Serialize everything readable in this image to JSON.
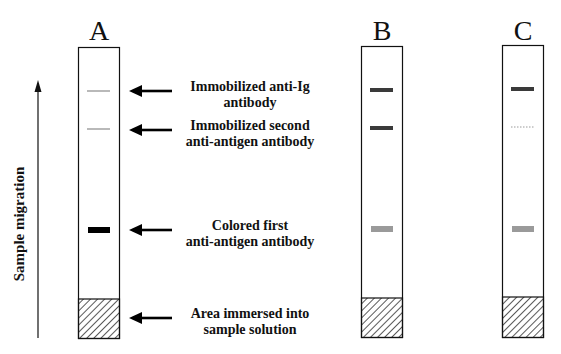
{
  "migration_label": "Sample migration",
  "strips": [
    {
      "id": "A",
      "label": "A",
      "bands": [
        {
          "role": "anti-ig",
          "style": "thin-line",
          "color": "#8a8a8a"
        },
        {
          "role": "second-antibody",
          "style": "thin-line",
          "color": "#8a8a8a"
        },
        {
          "role": "colored-first-antibody",
          "style": "thick-bar",
          "color": "#000000"
        }
      ]
    },
    {
      "id": "B",
      "label": "B",
      "bands": [
        {
          "role": "anti-ig",
          "style": "medium-bar",
          "color": "#3a3a3a"
        },
        {
          "role": "second-antibody",
          "style": "medium-bar",
          "color": "#3a3a3a"
        },
        {
          "role": "colored-first-antibody",
          "style": "medium-bar",
          "color": "#9a9a9a"
        }
      ]
    },
    {
      "id": "C",
      "label": "C",
      "bands": [
        {
          "role": "anti-ig",
          "style": "medium-bar",
          "color": "#3a3a3a"
        },
        {
          "role": "second-antibody",
          "style": "dotted",
          "color": "#9a9a9a"
        },
        {
          "role": "colored-first-antibody",
          "style": "medium-bar",
          "color": "#9a9a9a"
        }
      ]
    }
  ],
  "annotations": [
    {
      "role": "anti-ig",
      "lines": [
        "Immobilized anti-Ig",
        "antibody"
      ]
    },
    {
      "role": "second-antibody",
      "lines": [
        "Immobilized second",
        "anti-antigen antibody"
      ]
    },
    {
      "role": "colored-first-antibody",
      "lines": [
        "Colored first",
        "anti-antigen antibody"
      ]
    },
    {
      "role": "sample-area",
      "lines": [
        "Area immersed into",
        "sample solution"
      ]
    }
  ]
}
